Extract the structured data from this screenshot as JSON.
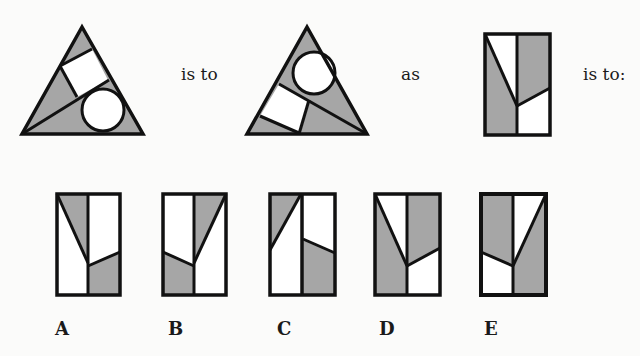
{
  "question": {
    "connector_1": "is to",
    "connector_2": "as",
    "connector_3": "is to:"
  },
  "colors": {
    "fill_shaded": "#a6a6a6",
    "fill_blank": "#ffffff",
    "stroke": "#111111"
  },
  "figures": {
    "stem_1": "triangle-with-square-top-circle-bottom-right",
    "stem_2": "triangle-with-circle-top-square-bottom-left",
    "stem_3": "rectangle-split-shaded"
  },
  "options": [
    {
      "label": "A"
    },
    {
      "label": "B"
    },
    {
      "label": "C"
    },
    {
      "label": "D"
    },
    {
      "label": "E"
    }
  ]
}
